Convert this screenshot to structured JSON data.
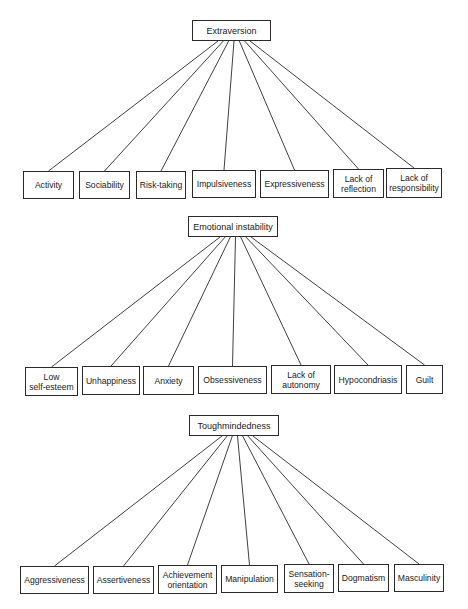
{
  "diagrams": [
    {
      "root": {
        "label": "Extraversion",
        "x": 192,
        "y": 20,
        "w": 79,
        "h": 21
      },
      "anchor": {
        "x_start": 218,
        "x_end": 250,
        "y": 41
      },
      "children": [
        {
          "label": "Activity",
          "x": 23,
          "y": 171,
          "w": 51,
          "h": 28
        },
        {
          "label": "Sociability",
          "x": 79,
          "y": 171,
          "w": 51,
          "h": 28
        },
        {
          "label": "Risk-taking",
          "x": 136,
          "y": 171,
          "w": 50,
          "h": 28
        },
        {
          "label": "Impulsiveness",
          "x": 192,
          "y": 170,
          "w": 64,
          "h": 28
        },
        {
          "label": "Expressiveness",
          "x": 260,
          "y": 170,
          "w": 69,
          "h": 28
        },
        {
          "label": "Lack of\nreflection",
          "x": 333,
          "y": 169,
          "w": 51,
          "h": 29
        },
        {
          "label": "Lack of\nresponsibility",
          "x": 386,
          "y": 168,
          "w": 56,
          "h": 30
        }
      ]
    },
    {
      "root": {
        "label": "Emotional instability",
        "x": 188,
        "y": 216,
        "w": 90,
        "h": 21
      },
      "anchor": {
        "x_start": 220,
        "x_end": 251,
        "y": 237
      },
      "children": [
        {
          "label": "Low\nself-esteem",
          "x": 25,
          "y": 367,
          "w": 53,
          "h": 29
        },
        {
          "label": "Unhappiness",
          "x": 82,
          "y": 366,
          "w": 58,
          "h": 29
        },
        {
          "label": "Anxiety",
          "x": 143,
          "y": 366,
          "w": 51,
          "h": 29
        },
        {
          "label": "Obsessiveness",
          "x": 198,
          "y": 366,
          "w": 69,
          "h": 28
        },
        {
          "label": "Lack of\nautonomy",
          "x": 271,
          "y": 365,
          "w": 60,
          "h": 29
        },
        {
          "label": "Hypocondriasis",
          "x": 334,
          "y": 365,
          "w": 68,
          "h": 29
        },
        {
          "label": "Guilt",
          "x": 406,
          "y": 365,
          "w": 37,
          "h": 29
        }
      ]
    },
    {
      "root": {
        "label": "Toughmindedness",
        "x": 189,
        "y": 415,
        "w": 90,
        "h": 21
      },
      "anchor": {
        "x_start": 222,
        "x_end": 253,
        "y": 436
      },
      "children": [
        {
          "label": "Aggressiveness",
          "x": 20,
          "y": 566,
          "w": 69,
          "h": 28
        },
        {
          "label": "Assertiveness",
          "x": 93,
          "y": 566,
          "w": 61,
          "h": 28
        },
        {
          "label": "Achievement\norientation",
          "x": 158,
          "y": 565,
          "w": 59,
          "h": 29
        },
        {
          "label": "Manipulation",
          "x": 221,
          "y": 565,
          "w": 57,
          "h": 28
        },
        {
          "label": "Sensation-\nseeking",
          "x": 284,
          "y": 564,
          "w": 50,
          "h": 29
        },
        {
          "label": "Dogmatism",
          "x": 338,
          "y": 564,
          "w": 51,
          "h": 28
        },
        {
          "label": "Masculinity",
          "x": 394,
          "y": 564,
          "w": 50,
          "h": 28
        }
      ]
    }
  ],
  "colors": {
    "line": "#2a2a2a",
    "box_border": "#2a2a2a",
    "background": "#ffffff",
    "text": "#1a1a1a"
  }
}
